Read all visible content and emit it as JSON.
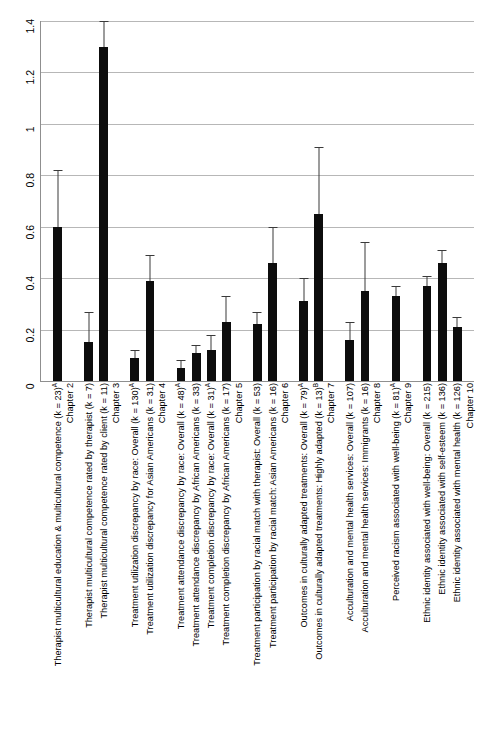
{
  "chart_data": {
    "type": "bar",
    "title": "",
    "xlabel": "",
    "ylabel": "",
    "ylim": [
      0,
      1.4
    ],
    "grid": true,
    "legend": "none",
    "orientation": "vertical",
    "error_bars": "95% confidence interval",
    "ytick_labels": [
      "0",
      "0.2",
      "0.4",
      "0.6",
      "0.8",
      "1",
      "1.2",
      "1.4"
    ],
    "ytick_values": [
      0,
      0.2,
      0.4,
      0.6,
      0.8,
      1.0,
      1.2,
      1.4
    ],
    "group_labels": [
      "Chapter 2",
      "Chapter 3",
      "Chapter 4",
      "Chapter 5",
      "Chapter 6",
      "Chapter 7",
      "Chapter 8",
      "Chapter 9",
      "Chapter 10"
    ],
    "categories": [
      "Therapist multicultural education & multicultural competence (k = 23)",
      "Therapist multicultural competence rated by therapist (k = 7)",
      "Therapist multicultural competence rated by client (k = 11)",
      "Treatment utilization discrepancy by race: Overall (k = 130)",
      "Treatment utilization discrepancy for Asian Americans (k = 31)",
      "Treatment attendance discrepancy by race: Overall (k = 48)",
      "Treatment attendance discrepancy by African Americans (k = 33)",
      "Treatment completion discrepancy by race: Overall (k = 31)",
      "Treatment completion discrepancy by African Americans (k = 17)",
      "Treatment participation by racial match with therapist: Overall (k = 53)",
      "Treatment participation by racial match: Asian Americans (k = 16)",
      "Outcomes in culturally adapted treatments: Overall (k = 79)",
      "Outcomes in culturally adapted treatments: Highly adapted (k = 13)",
      "Acculturation and mental health services: Overall (k = 107)",
      "Acculturation and mental health services: Immigrants (k = 16)",
      "Perceived racism associated with well-being (k = 81)",
      "Ethnic identity associated with well-being: Overall (k = 215)",
      "Ethnic identity associated with self-esteem (k = 136)",
      "Ethnic identity associated with mental health (k = 126)"
    ],
    "values": [
      0.6,
      0.15,
      1.3,
      0.09,
      0.39,
      0.05,
      0.11,
      0.12,
      0.23,
      0.22,
      0.46,
      0.31,
      0.65,
      0.16,
      0.35,
      0.33,
      0.37,
      0.46,
      0.21
    ],
    "err_low": [
      0.6,
      0.15,
      1.3,
      0.09,
      0.39,
      0.05,
      0.11,
      0.12,
      0.23,
      0.22,
      0.46,
      0.31,
      0.65,
      0.16,
      0.35,
      0.33,
      0.37,
      0.46,
      0.21
    ],
    "err_high": [
      0.82,
      0.27,
      1.4,
      0.12,
      0.49,
      0.08,
      0.14,
      0.18,
      0.33,
      0.27,
      0.6,
      0.4,
      0.91,
      0.23,
      0.54,
      0.37,
      0.41,
      0.51,
      0.25
    ],
    "bars": [
      {
        "group": "Chapter 2",
        "label": "Therapist multicultural education & multicultural competence (k = 23)",
        "sup": "A",
        "value": 0.6,
        "ci_upper": 0.82
      },
      {
        "group": "Chapter 3",
        "label": "Therapist multicultural competence rated by therapist (k = 7)",
        "sup": "",
        "value": 0.15,
        "ci_upper": 0.27
      },
      {
        "group": "Chapter 3",
        "label": "Therapist multicultural competence rated by client (k = 11)",
        "sup": "",
        "value": 1.3,
        "ci_upper": 1.4
      },
      {
        "group": "Chapter 4",
        "label": "Treatment utilization discrepancy by race: Overall (k = 130)",
        "sup": "A",
        "value": 0.09,
        "ci_upper": 0.12
      },
      {
        "group": "Chapter 4",
        "label": "Treatment utilization discrepancy for Asian Americans (k = 31)",
        "sup": "",
        "value": 0.39,
        "ci_upper": 0.49
      },
      {
        "group": "Chapter 5",
        "label": "Treatment attendance discrepancy by race: Overall (k = 48)",
        "sup": "A",
        "value": 0.05,
        "ci_upper": 0.08
      },
      {
        "group": "Chapter 5",
        "label": "Treatment attendance discrepancy by African Americans (k = 33)",
        "sup": "",
        "value": 0.11,
        "ci_upper": 0.14
      },
      {
        "group": "Chapter 5",
        "label": "Treatment completion discrepancy by race: Overall (k = 31)",
        "sup": "A",
        "value": 0.12,
        "ci_upper": 0.18
      },
      {
        "group": "Chapter 5",
        "label": "Treatment completion discrepancy by African Americans (k = 17)",
        "sup": "",
        "value": 0.23,
        "ci_upper": 0.33
      },
      {
        "group": "Chapter 6",
        "label": "Treatment participation by racial match with therapist: Overall (k = 53)",
        "sup": "",
        "value": 0.22,
        "ci_upper": 0.27
      },
      {
        "group": "Chapter 6",
        "label": "Treatment participation by racial match: Asian Americans (k = 16)",
        "sup": "",
        "value": 0.46,
        "ci_upper": 0.6
      },
      {
        "group": "Chapter 7",
        "label": "Outcomes in culturally adapted treatments: Overall (k = 79)",
        "sup": "A",
        "value": 0.31,
        "ci_upper": 0.4
      },
      {
        "group": "Chapter 7",
        "label": "Outcomes in culturally adapted treatments: Highly adapted (k = 13)",
        "sup": "B",
        "value": 0.65,
        "ci_upper": 0.91
      },
      {
        "group": "Chapter 8",
        "label": "Acculturation and mental health services: Overall (k = 107)",
        "sup": "",
        "value": 0.16,
        "ci_upper": 0.23
      },
      {
        "group": "Chapter 8",
        "label": "Acculturation and mental health services: Immigrants (k = 16)",
        "sup": "",
        "value": 0.35,
        "ci_upper": 0.54
      },
      {
        "group": "Chapter 9",
        "label": "Perceived racism associated with well-being (k = 81)",
        "sup": "A",
        "value": 0.33,
        "ci_upper": 0.37
      },
      {
        "group": "Chapter 10",
        "label": "Ethnic identity associated with well-being: Overall (k = 215)",
        "sup": "",
        "value": 0.37,
        "ci_upper": 0.41
      },
      {
        "group": "Chapter 10",
        "label": "Ethnic identity associated with self-esteem (k = 136)",
        "sup": "",
        "value": 0.46,
        "ci_upper": 0.51
      },
      {
        "group": "Chapter 10",
        "label": "Ethnic identity associated with mental health (k = 126)",
        "sup": "",
        "value": 0.21,
        "ci_upper": 0.25
      }
    ],
    "colors": {
      "bar": "#0d0d0d",
      "error": "#3a3a3a",
      "grid": "#b7b7b7",
      "axis": "#8f8f8f",
      "text": "#000000",
      "background": "#ffffff"
    }
  }
}
